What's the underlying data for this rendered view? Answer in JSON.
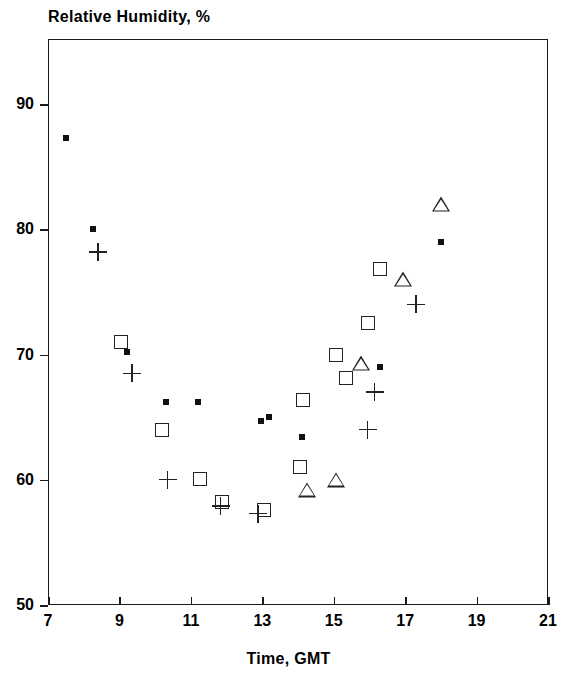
{
  "chart_data": {
    "type": "scatter",
    "title": "Relative Humidity, %",
    "xlabel": "Time, GMT",
    "ylabel": "",
    "xlim": [
      7,
      21
    ],
    "ylim": [
      50,
      95.2
    ],
    "xticks": [
      "7",
      "9",
      "11",
      "13",
      "15",
      "17",
      "19",
      "21"
    ],
    "xtick_values": [
      7,
      9,
      11,
      13,
      15,
      17,
      19,
      21
    ],
    "yticks": [
      "50",
      "60",
      "70",
      "80",
      "90"
    ],
    "ytick_values": [
      50,
      60,
      70,
      80,
      90
    ],
    "grid": false,
    "legend": "none",
    "series": [
      {
        "name": "filled-square",
        "marker": "filled-square",
        "points": [
          {
            "x": 7.5,
            "y": 87.3
          },
          {
            "x": 8.25,
            "y": 80.0
          },
          {
            "x": 9.2,
            "y": 70.2
          },
          {
            "x": 10.3,
            "y": 66.2
          },
          {
            "x": 11.2,
            "y": 66.2
          },
          {
            "x": 12.95,
            "y": 64.7
          },
          {
            "x": 13.2,
            "y": 65.0
          },
          {
            "x": 14.1,
            "y": 63.4
          },
          {
            "x": 16.3,
            "y": 69.0
          },
          {
            "x": 18.0,
            "y": 79.0
          }
        ]
      },
      {
        "name": "plus",
        "marker": "plus",
        "points": [
          {
            "x": 8.4,
            "y": 78.2
          },
          {
            "x": 9.35,
            "y": 68.5
          },
          {
            "x": 10.35,
            "y": 60.0
          },
          {
            "x": 11.83,
            "y": 57.9
          },
          {
            "x": 12.88,
            "y": 57.3
          },
          {
            "x": 15.95,
            "y": 64.0
          },
          {
            "x": 16.15,
            "y": 67.0
          },
          {
            "x": 17.3,
            "y": 74.0
          }
        ]
      },
      {
        "name": "open-square",
        "marker": "open-square",
        "points": [
          {
            "x": 9.05,
            "y": 71.0
          },
          {
            "x": 10.2,
            "y": 64.0
          },
          {
            "x": 11.25,
            "y": 60.1
          },
          {
            "x": 11.88,
            "y": 58.2
          },
          {
            "x": 13.05,
            "y": 57.6
          },
          {
            "x": 14.05,
            "y": 61.0
          },
          {
            "x": 14.15,
            "y": 66.4
          },
          {
            "x": 15.05,
            "y": 70.0
          },
          {
            "x": 15.35,
            "y": 68.1
          },
          {
            "x": 15.95,
            "y": 72.5
          },
          {
            "x": 16.3,
            "y": 76.8
          }
        ]
      },
      {
        "name": "triangle",
        "marker": "triangle",
        "points": [
          {
            "x": 14.25,
            "y": 59.2
          },
          {
            "x": 15.05,
            "y": 60.0
          },
          {
            "x": 15.75,
            "y": 69.3
          },
          {
            "x": 16.95,
            "y": 76.0
          },
          {
            "x": 18.0,
            "y": 82.0
          }
        ]
      }
    ]
  }
}
